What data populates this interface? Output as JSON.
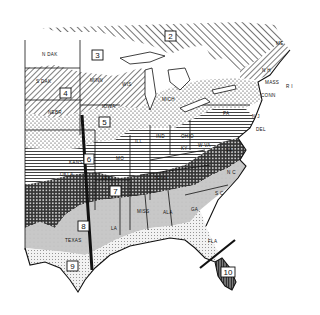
{
  "map": {
    "title": "Plant Hardiness Zones - Eastern United States",
    "zones": [
      {
        "id": "2",
        "label": "2",
        "x": 171,
        "y": 38
      },
      {
        "id": "3",
        "label": "3",
        "x": 98,
        "y": 57
      },
      {
        "id": "4",
        "label": "4",
        "x": 65,
        "y": 94
      },
      {
        "id": "5",
        "label": "5",
        "x": 104,
        "y": 123
      },
      {
        "id": "6",
        "label": "6",
        "x": 89,
        "y": 160
      },
      {
        "id": "7",
        "label": "7",
        "x": 115,
        "y": 192
      },
      {
        "id": "8",
        "label": "8",
        "x": 83,
        "y": 227
      },
      {
        "id": "9",
        "label": "9",
        "x": 72,
        "y": 266
      },
      {
        "id": "10",
        "label": "10",
        "x": 228,
        "y": 272
      }
    ],
    "states": [
      {
        "label": "N DAK",
        "x": 42,
        "y": 56
      },
      {
        "label": "S DAK",
        "x": 36,
        "y": 83
      },
      {
        "label": "NEBR",
        "x": 48,
        "y": 114
      },
      {
        "label": "MINN",
        "x": 90,
        "y": 82
      },
      {
        "label": "WIS",
        "x": 122,
        "y": 86
      },
      {
        "label": "IOWA",
        "x": 102,
        "y": 108
      },
      {
        "label": "MICH",
        "x": 162,
        "y": 101
      },
      {
        "label": "ILL",
        "x": 135,
        "y": 143
      },
      {
        "label": "IND",
        "x": 156,
        "y": 138
      },
      {
        "label": "OHIO",
        "x": 181,
        "y": 138
      },
      {
        "label": "PA",
        "x": 223,
        "y": 115
      },
      {
        "label": "W VA",
        "x": 198,
        "y": 147
      },
      {
        "label": "KY",
        "x": 181,
        "y": 150
      },
      {
        "label": "VA",
        "x": 226,
        "y": 152
      },
      {
        "label": "MO",
        "x": 116,
        "y": 160
      },
      {
        "label": "KANS",
        "x": 69,
        "y": 164
      },
      {
        "label": "OKLA",
        "x": 60,
        "y": 176
      },
      {
        "label": "ARK",
        "x": 101,
        "y": 180
      },
      {
        "label": "TENN",
        "x": 154,
        "y": 180
      },
      {
        "label": "N C",
        "x": 227,
        "y": 174
      },
      {
        "label": "S C",
        "x": 215,
        "y": 195
      },
      {
        "label": "GA",
        "x": 191,
        "y": 211
      },
      {
        "label": "ALA",
        "x": 163,
        "y": 214
      },
      {
        "label": "MISS",
        "x": 137,
        "y": 213
      },
      {
        "label": "LA",
        "x": 111,
        "y": 230
      },
      {
        "label": "TEXAS",
        "x": 65,
        "y": 242
      },
      {
        "label": "FLA",
        "x": 208,
        "y": 243
      },
      {
        "label": "ME",
        "x": 276,
        "y": 45
      },
      {
        "label": "N H",
        "x": 262,
        "y": 72
      },
      {
        "label": "MASS",
        "x": 265,
        "y": 84
      },
      {
        "label": "R I",
        "x": 286,
        "y": 88
      },
      {
        "label": "CONN",
        "x": 261,
        "y": 97
      },
      {
        "label": "N J",
        "x": 252,
        "y": 118
      },
      {
        "label": "DEL",
        "x": 256,
        "y": 131
      }
    ],
    "colors": {
      "ink": "#111111",
      "paper": "#ffffff",
      "zone8_fill": "#c8c8c8",
      "zone9_fill": "#e8e8e8"
    }
  }
}
